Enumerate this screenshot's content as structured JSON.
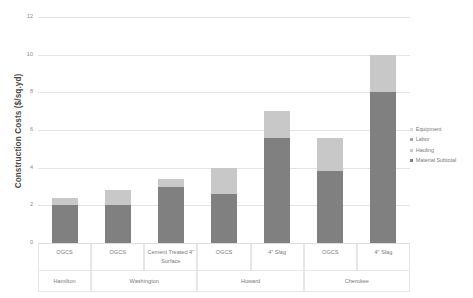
{
  "chart_data": {
    "type": "bar",
    "subtype": "stacked-bar-grouped",
    "title": "",
    "xlabel": "",
    "ylabel": "Construction Costs ($/sq.yd)",
    "ylim": [
      0,
      12
    ],
    "ytick_step": 2,
    "ytick_labels": [
      "0",
      "2",
      "4",
      "6",
      "8",
      "10",
      "12"
    ],
    "grid": true,
    "legend_position": "right",
    "legend_entries": [
      "Equipment",
      "Labor",
      "Hauling",
      "Material Subtotal"
    ],
    "series": [
      {
        "name": "Material Subtotal",
        "color": "#808080",
        "values": [
          2.0,
          2.0,
          3.0,
          2.6,
          5.6,
          3.8,
          8.0
        ]
      },
      {
        "name": "Hauling",
        "color": "#c8c8c8",
        "values": [
          0.4,
          0.8,
          0.4,
          1.4,
          1.4,
          1.8,
          2.0
        ]
      },
      {
        "name": "Labor",
        "color": "#a6a6a6",
        "values": [
          0,
          0,
          0,
          0,
          0,
          0,
          0
        ]
      },
      {
        "name": "Equipment",
        "color": "#d9d9d9",
        "values": [
          0,
          0,
          0,
          0,
          0,
          0,
          0
        ]
      }
    ],
    "categories": [
      "OGCS",
      "OGCS",
      "Cement Treated 4\" Surface",
      "OGCS",
      "4\" Slag",
      "OGCS",
      "4\" Slag"
    ],
    "totals": [
      2.4,
      2.8,
      3.4,
      4.0,
      7.0,
      5.6,
      10.0
    ],
    "groups": [
      {
        "label": "Hamilton",
        "span": 1
      },
      {
        "label": "Washington",
        "span": 2
      },
      {
        "label": "Howard",
        "span": 2
      },
      {
        "label": "Cherokee",
        "span": 2
      }
    ]
  },
  "legend": {
    "items": [
      {
        "label": "Equipment",
        "color": "#d9d9d9"
      },
      {
        "label": "Labor",
        "color": "#a6a6a6"
      },
      {
        "label": "Hauling",
        "color": "#c8c8c8"
      },
      {
        "label": "Material Subtotal",
        "color": "#808080"
      }
    ]
  },
  "axis": {
    "y_title": "Construction Costs ($/sq.yd)"
  }
}
